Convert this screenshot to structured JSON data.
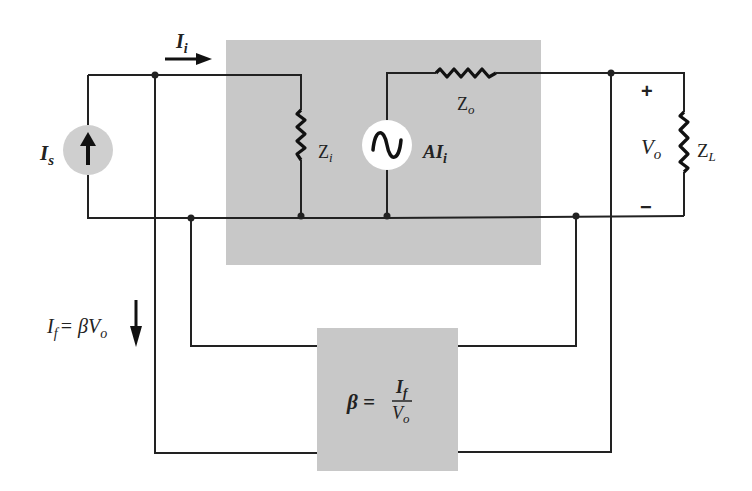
{
  "diagram": {
    "colors": {
      "block_fill": "#c8c8c8",
      "source_fill": "#cfcfcf",
      "wire": "#222222",
      "background": "#ffffff"
    },
    "labels": {
      "source_current": "I",
      "source_current_sub": "s",
      "input_current": "I",
      "input_current_sub": "i",
      "input_impedance": "Z",
      "input_impedance_sub": "i",
      "output_impedance": "Z",
      "output_impedance_sub": "o",
      "dependent_source": "AI",
      "dependent_source_sub": "i",
      "output_voltage": "V",
      "output_voltage_sub": "o",
      "load_impedance": "Z",
      "load_impedance_sub": "L",
      "plus": "+",
      "minus": "−",
      "feedback_current_lhs": "I",
      "feedback_current_lhs_sub": "f",
      "feedback_current_rhs": "= βV",
      "feedback_current_rhs_sub": "o",
      "beta_lhs": "β =",
      "beta_num": "I",
      "beta_num_sub": "f",
      "beta_den": "V",
      "beta_den_sub": "o"
    },
    "blocks": [
      {
        "name": "amplifier",
        "x": 226,
        "y": 40,
        "w": 315,
        "h": 225
      },
      {
        "name": "feedback-network",
        "x": 317,
        "y": 328,
        "w": 141,
        "h": 143
      }
    ]
  }
}
